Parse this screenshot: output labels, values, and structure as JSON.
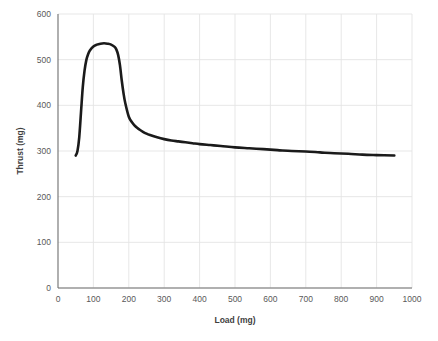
{
  "chart_data": {
    "type": "line",
    "title": "",
    "subtitle": "",
    "xlabel": "Load (mg)",
    "ylabel": "Thrust (mg)",
    "xlim": [
      0,
      1000
    ],
    "ylim": [
      0,
      600
    ],
    "xticks": [
      0,
      100,
      200,
      300,
      400,
      500,
      600,
      700,
      800,
      900,
      1000
    ],
    "yticks": [
      0,
      100,
      200,
      300,
      400,
      500,
      600
    ],
    "xtick_labels": [
      "0",
      "100",
      "200",
      "300",
      "400",
      "500",
      "600",
      "700",
      "800",
      "900",
      "1000"
    ],
    "ytick_labels": [
      "0",
      "100",
      "200",
      "300",
      "400",
      "500",
      "600"
    ],
    "grid": true,
    "grid_axis": "both",
    "legend": false,
    "legend_position": "none",
    "series": [
      {
        "name": "Thrust vs Load",
        "color": "#1a1a1a",
        "line_width": 2.6,
        "markers": false,
        "x": [
          50,
          55,
          60,
          65,
          70,
          75,
          80,
          85,
          90,
          100,
          110,
          120,
          130,
          140,
          150,
          160,
          165,
          170,
          175,
          180,
          185,
          190,
          200,
          210,
          220,
          230,
          240,
          250,
          260,
          280,
          300,
          320,
          340,
          360,
          380,
          400,
          430,
          460,
          500,
          540,
          580,
          620,
          660,
          700,
          740,
          780,
          820,
          860,
          900,
          950
        ],
        "y": [
          290,
          300,
          330,
          385,
          440,
          476,
          499,
          512,
          520,
          529,
          533,
          535,
          536,
          535,
          533,
          528,
          522,
          510,
          488,
          455,
          427,
          405,
          375,
          362,
          353,
          347,
          342,
          338,
          335,
          330,
          326,
          323,
          321,
          319,
          317,
          315,
          313,
          311,
          308,
          306,
          304,
          302,
          300,
          299,
          297,
          295,
          294,
          292,
          291,
          290
        ]
      }
    ],
    "annotations": [],
    "notes": {
      "peak_thrust": 536,
      "peak_load": 130,
      "start_point": [
        50,
        290
      ],
      "end_point": [
        950,
        290
      ]
    },
    "colors": {
      "curve": "#1a1a1a",
      "gridline": "#e4e4e4",
      "axis": "#6e6e6e",
      "tick_text": "#595959",
      "axis_title_text": "#3f3f3f",
      "background": "#ffffff"
    }
  }
}
